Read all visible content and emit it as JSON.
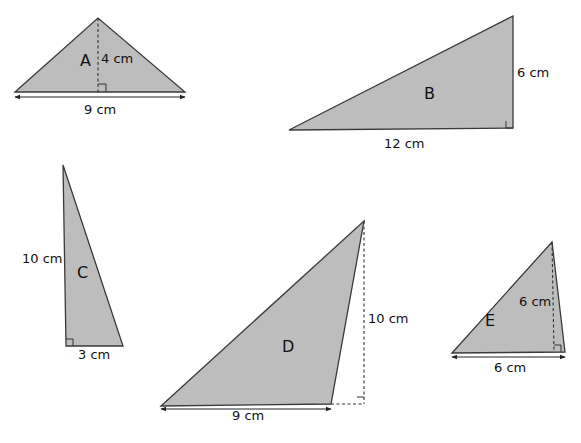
{
  "diagram": {
    "colors": {
      "fill": "#bdbdbd",
      "stroke": "#3a3a3a",
      "text": "#111111",
      "background": "#ffffff"
    },
    "triangles": [
      {
        "id": "A",
        "label": "A",
        "points": [
          [
            15,
            92
          ],
          [
            98,
            18
          ],
          [
            185,
            92
          ]
        ],
        "label_pos": [
          80,
          66
        ],
        "height_line": [
          [
            98,
            18
          ],
          [
            98,
            92
          ]
        ],
        "height_dashed": true,
        "right_angle": [
          [
            98,
            84
          ],
          [
            106,
            84
          ],
          [
            106,
            92
          ]
        ],
        "base_arrow": [
          [
            15,
            97
          ],
          [
            185,
            97
          ]
        ],
        "measurements": [
          {
            "text": "4 cm",
            "pos": [
              101,
              63
            ],
            "kind": "height"
          },
          {
            "text": "9 cm",
            "pos": [
              84,
              114
            ],
            "kind": "base"
          }
        ]
      },
      {
        "id": "B",
        "label": "B",
        "points": [
          [
            289,
            130
          ],
          [
            513,
            16
          ],
          [
            513,
            128
          ]
        ],
        "label_pos": [
          424,
          99
        ],
        "right_angle": [
          [
            506,
            121
          ],
          [
            506,
            128
          ],
          [
            513,
            128
          ]
        ],
        "measurements": [
          {
            "text": "6 cm",
            "pos": [
              517,
              77
            ],
            "kind": "height"
          },
          {
            "text": "12 cm",
            "pos": [
              384,
              148
            ],
            "kind": "base"
          }
        ]
      },
      {
        "id": "C",
        "label": "C",
        "points": [
          [
            63,
            165
          ],
          [
            66,
            346
          ],
          [
            123,
            346
          ]
        ],
        "label_pos": [
          77,
          278
        ],
        "right_angle": [
          [
            66,
            339
          ],
          [
            73,
            339
          ],
          [
            73,
            346
          ]
        ],
        "measurements": [
          {
            "text": "10 cm",
            "pos": [
              22,
              263
            ],
            "kind": "height"
          },
          {
            "text": "3 cm",
            "pos": [
              78,
              359
            ],
            "kind": "base"
          }
        ]
      },
      {
        "id": "D",
        "label": "D",
        "points": [
          [
            161,
            406
          ],
          [
            364,
            221
          ],
          [
            331,
            404
          ]
        ],
        "label_pos": [
          282,
          352
        ],
        "height_line": [
          [
            364,
            221
          ],
          [
            364,
            404
          ]
        ],
        "height_dashed": true,
        "extension_line": [
          [
            331,
            404
          ],
          [
            364,
            404
          ]
        ],
        "right_angle": [
          [
            357,
            397
          ],
          [
            364,
            397
          ]
        ],
        "base_arrow": [
          [
            161,
            409
          ],
          [
            331,
            409
          ]
        ],
        "measurements": [
          {
            "text": "10 cm",
            "pos": [
              368,
              323
            ],
            "kind": "height"
          },
          {
            "text": "9 cm",
            "pos": [
              232,
              420
            ],
            "kind": "base"
          }
        ]
      },
      {
        "id": "E",
        "label": "E",
        "points": [
          [
            452,
            353
          ],
          [
            552,
            242
          ],
          [
            565,
            352
          ]
        ],
        "label_pos": [
          485,
          326
        ],
        "height_line": [
          [
            552,
            242
          ],
          [
            554,
            352
          ]
        ],
        "height_dashed": true,
        "right_angle": [
          [
            554,
            345
          ],
          [
            561,
            345
          ],
          [
            561,
            352
          ]
        ],
        "base_arrow": [
          [
            452,
            357
          ],
          [
            565,
            357
          ]
        ],
        "measurements": [
          {
            "text": "6 cm",
            "pos": [
              519,
              306
            ],
            "kind": "height"
          },
          {
            "text": "6 cm",
            "pos": [
              494,
              372
            ],
            "kind": "base"
          }
        ]
      }
    ]
  }
}
